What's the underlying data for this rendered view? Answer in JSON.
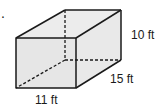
{
  "figure": {
    "shape": "rectangular prism",
    "marker": ".",
    "dimensions": {
      "height": "10 ft",
      "depth": "15 ft",
      "width": "11 ft"
    },
    "colors": {
      "face": "#e6e6e6",
      "edge": "#1a1a1a"
    }
  }
}
